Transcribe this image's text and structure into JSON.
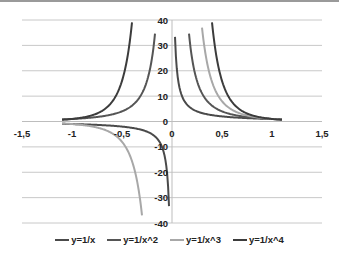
{
  "chart_data": {
    "type": "line",
    "title": "",
    "xlabel": "",
    "ylabel": "",
    "xlim": [
      -1.5,
      1.5
    ],
    "ylim": [
      -40,
      40
    ],
    "x_ticks": [
      "-1,5",
      "-1",
      "-0,5",
      "0",
      "0,5",
      "1",
      "1,5"
    ],
    "y_ticks": [
      "40",
      "30",
      "20",
      "10",
      "0",
      "-10",
      "-20",
      "-30",
      "-40"
    ],
    "grid": true,
    "legend_position": "bottom",
    "series": [
      {
        "name": "y=1/x",
        "color": "#4a4a4a",
        "formula": "1/x",
        "x_ranges": [
          [
            -1.1,
            -0.03
          ],
          [
            0.03,
            1.1
          ]
        ]
      },
      {
        "name": "y=1/x^2",
        "color": "#555555",
        "formula": "1/x^2",
        "x_ranges": [
          [
            -1.1,
            -0.17
          ],
          [
            0.17,
            1.1
          ]
        ]
      },
      {
        "name": "y=1/x^3",
        "color": "#a8a8a8",
        "formula": "1/x^3",
        "x_ranges": [
          [
            -1.1,
            -0.3
          ],
          [
            0.3,
            1.1
          ]
        ]
      },
      {
        "name": "y=1/x^4",
        "color": "#3c3c3c",
        "formula": "1/x^4",
        "x_ranges": [
          [
            -1.1,
            -0.4
          ],
          [
            0.4,
            1.1
          ]
        ]
      }
    ]
  },
  "legend": {
    "items": [
      {
        "label": "y=1/x",
        "color": "#4a4a4a"
      },
      {
        "label": "y=1/x^2",
        "color": "#555555"
      },
      {
        "label": "y=1/x^3",
        "color": "#a8a8a8"
      },
      {
        "label": "y=1/x^4",
        "color": "#3c3c3c"
      }
    ]
  }
}
